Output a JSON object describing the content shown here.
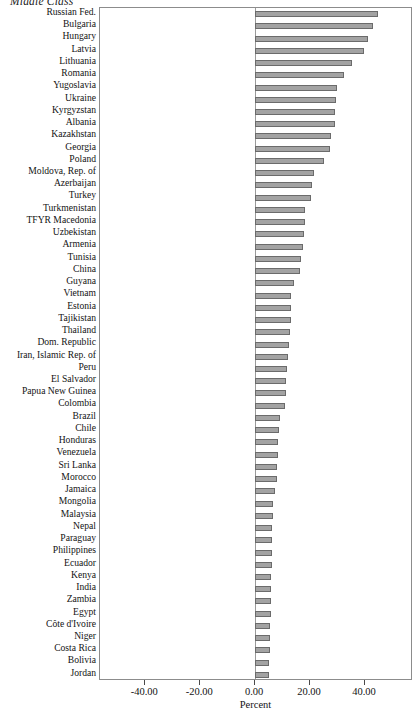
{
  "chart_data": {
    "type": "bar",
    "orientation": "horizontal",
    "title": "Middle Class",
    "xlabel": "Percent",
    "ylabel": "",
    "xlim": [
      -56.5,
      57.5
    ],
    "xticks": [
      -40,
      -20,
      0,
      20,
      40
    ],
    "xtick_labels": [
      "-40.00",
      "-20.00",
      "0.00",
      "20.00",
      "40.00"
    ],
    "grid": false,
    "legend": null,
    "bar_color": "#a3a3a3",
    "bar_edge_color": "#6b6b6b",
    "frame_color": "#8c8c8c",
    "categories": [
      "Russian Fed.",
      "Bulgaria",
      "Hungary",
      "Latvia",
      "Lithuania",
      "Romania",
      "Yugoslavia",
      "Ukraine",
      "Kyrgyzstan",
      "Albania",
      "Kazakhstan",
      "Georgia",
      "Poland",
      "Moldova, Rep. of",
      "Azerbaijan",
      "Turkey",
      "Turkmenistan",
      "TFYR Macedonia",
      "Uzbekistan",
      "Armenia",
      "Tunisia",
      "China",
      "Guyana",
      "Vietnam",
      "Estonia",
      "Tajikistan",
      "Thailand",
      "Dom. Republic",
      "Iran, Islamic Rep. of",
      "Peru",
      "El Salvador",
      "Papua New Guinea",
      "Colombia",
      "Brazil",
      "Chile",
      "Honduras",
      "Venezuela",
      "Sri Lanka",
      "Morocco",
      "Jamaica",
      "Mongolia",
      "Malaysia",
      "Nepal",
      "Paraguay",
      "Philippines",
      "Ecuador",
      "Kenya",
      "India",
      "Zambia",
      "Egypt",
      "Côte d'Ivoire",
      "Niger",
      "Costa Rica",
      "Bolivia",
      "Jordan"
    ],
    "values": [
      44.6,
      43.1,
      41.2,
      39.7,
      35.4,
      32.4,
      29.8,
      29.6,
      29.2,
      29.1,
      27.8,
      27.3,
      25.0,
      21.4,
      20.6,
      20.3,
      18.2,
      18.0,
      17.8,
      17.5,
      16.6,
      16.4,
      14.1,
      13.1,
      13.0,
      12.9,
      12.6,
      12.3,
      11.8,
      11.5,
      11.4,
      11.2,
      10.7,
      8.9,
      8.7,
      8.5,
      8.2,
      8.1,
      8.0,
      7.3,
      6.5,
      6.4,
      6.3,
      6.2,
      6.1,
      6.0,
      5.9,
      5.8,
      5.7,
      5.6,
      5.5,
      5.4,
      5.3,
      5.2,
      5.0
    ]
  },
  "axis": {
    "x_title": "Percent"
  }
}
